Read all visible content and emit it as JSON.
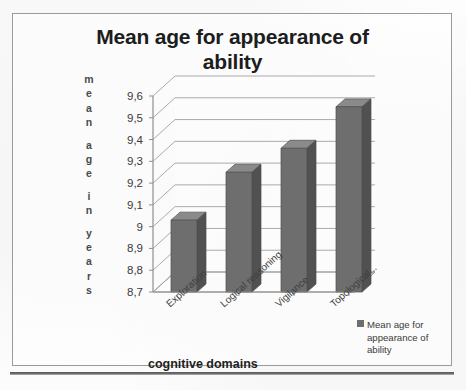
{
  "chart_data": {
    "type": "bar",
    "title": "Mean age for appearance of ability",
    "title_line1": "Mean age for appearance of",
    "title_line2": "ability",
    "xlabel": "cognitive domains",
    "ylabel": "mean age in years",
    "ylabel_letters": [
      "m",
      "e",
      "a",
      "n",
      "",
      "a",
      "g",
      "e",
      "",
      "i",
      "n",
      "",
      "y",
      "e",
      "a",
      "r",
      "s"
    ],
    "categories": [
      "Exploration",
      "Logical reasoning",
      "Vigilance",
      "Topological..."
    ],
    "values": [
      9.03,
      9.25,
      9.36,
      9.55
    ],
    "series": [
      {
        "name": "Mean age for appearance of ability",
        "values": [
          9.03,
          9.25,
          9.36,
          9.55
        ]
      }
    ],
    "ylim": [
      8.7,
      9.6
    ],
    "ytick_labels": [
      "8,7",
      "8,8",
      "8,9",
      "9",
      "9,1",
      "9,2",
      "9,3",
      "9,4",
      "9,5",
      "9,6"
    ],
    "ytick_values": [
      8.7,
      8.8,
      8.9,
      9.0,
      9.1,
      9.2,
      9.3,
      9.4,
      9.5,
      9.6
    ],
    "grid": true,
    "legend_position": "right-bottom",
    "legend_entries": [
      "Mean age for appearance of ability"
    ],
    "bar_color": "#6e6e6e",
    "bar_side_color": "#515151",
    "bar_top_color": "#8a8a8a",
    "gridline_color": "#9d9d9d",
    "axis_color": "#8f8f8f",
    "three_d": true
  },
  "legend": {
    "marker_name": "legend-swatch",
    "line1": "Mean age for",
    "line2": "appearance of",
    "line3": "ability"
  }
}
